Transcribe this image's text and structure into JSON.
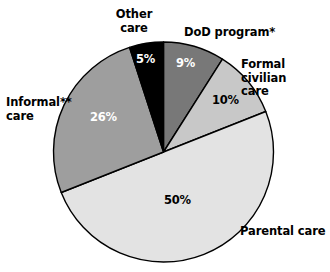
{
  "chart_data": {
    "type": "pie",
    "title": "",
    "subtitle": "",
    "xlabel": "",
    "ylabel": "",
    "legend_position": "none",
    "grid": false,
    "start_angle_deg": 0,
    "direction": "clockwise",
    "categories": [
      "DoD program*",
      "Formal civilian care",
      "Parental care",
      "Informal** care",
      "Other care"
    ],
    "values": [
      9,
      10,
      50,
      26,
      5
    ],
    "value_labels": [
      "9%",
      "10%",
      "50%",
      "26%",
      "5%"
    ],
    "colors": [
      "#787878",
      "#c8c8c8",
      "#e3e3e3",
      "#9e9e9e",
      "#000000"
    ],
    "label_text_colors": [
      "#ffffff",
      "#000000",
      "#000000",
      "#ffffff",
      "#ffffff"
    ],
    "slices": [
      {
        "name": "DoD program*",
        "label": "DoD program*",
        "value": 9,
        "value_label": "9%",
        "color": "#787878",
        "text_color": "#ffffff"
      },
      {
        "name": "Formal civilian care",
        "label": "Formal civilian\ncare",
        "value": 10,
        "value_label": "10%",
        "color": "#c8c8c8",
        "text_color": "#000000"
      },
      {
        "name": "Parental care",
        "label": "Parental care",
        "value": 50,
        "value_label": "50%",
        "color": "#e3e3e3",
        "text_color": "#000000"
      },
      {
        "name": "Informal** care",
        "label": "Informal**\ncare",
        "value": 26,
        "value_label": "26%",
        "color": "#9e9e9e",
        "text_color": "#ffffff"
      },
      {
        "name": "Other care",
        "label": "Other\ncare",
        "value": 5,
        "value_label": "5%",
        "color": "#000000",
        "text_color": "#ffffff"
      }
    ],
    "outline_color": "#000000",
    "background_color": "#ffffff"
  },
  "labels": {
    "other_care": "Other\ncare",
    "dod_program": "DoD program*",
    "formal_civilian_care": "Formal civilian\ncare",
    "parental_care": "Parental care",
    "informal_care": "Informal**\ncare"
  },
  "percentages": {
    "other_care": "5%",
    "dod_program": "9%",
    "formal_civilian_care": "10%",
    "parental_care": "50%",
    "informal_care": "26%"
  }
}
